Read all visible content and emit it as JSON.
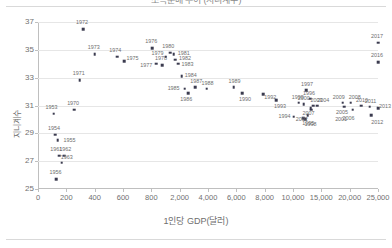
{
  "figure": {
    "title_clipped": "소득분배 추이 (지니계수)",
    "background": "#ffffff",
    "marker_color": "#3b3b4f",
    "grid_color": "#e6e6e6",
    "axis_color": "#bfbfbf",
    "text_color": "#6e6e6e"
  },
  "chart_data": {
    "type": "scatter",
    "title": "소득분배 추이 (지니계수)",
    "xlabel": "1인당 GDP(달러)",
    "ylabel": "지니계수",
    "grid": "horizontal",
    "legend": "none",
    "xscale": "piecewise-compressed",
    "ylim": [
      25,
      37
    ],
    "yticks": [
      25,
      27,
      29,
      31,
      33,
      35,
      37
    ],
    "xticks": [
      0,
      200,
      400,
      600,
      800,
      2000,
      4000,
      6000,
      8000,
      10000,
      15000,
      20000,
      25000
    ],
    "xticklabels": [
      "0",
      "200",
      "400",
      "600",
      "800",
      "2,000",
      "4,000",
      "6,000",
      "8,000",
      "10,000",
      "15,000",
      "20,000",
      "25,000"
    ],
    "point_label_field": "year",
    "points": [
      {
        "year": "1953",
        "x": 110,
        "y": 30.4,
        "lx": -2,
        "ly": -7
      },
      {
        "year": "1954",
        "x": 120,
        "y": 28.9,
        "lx": -1,
        "ly": -7
      },
      {
        "year": "1955",
        "x": 138,
        "y": 28.5,
        "lx": 12,
        "ly": 0
      },
      {
        "year": "1956",
        "x": 130,
        "y": 25.7,
        "lx": -1,
        "ly": -7
      },
      {
        "year": "1961",
        "x": 150,
        "y": 27.4,
        "lx": -3,
        "ly": -7
      },
      {
        "year": "1962",
        "x": 185,
        "y": 27.4,
        "lx": 1,
        "ly": -7
      },
      {
        "year": "1963",
        "x": 168,
        "y": 26.9,
        "lx": 5,
        "ly": -6
      },
      {
        "year": "1970",
        "x": 255,
        "y": 30.7,
        "lx": -1,
        "ly": -7
      },
      {
        "year": "1971",
        "x": 295,
        "y": 32.8,
        "lx": -1,
        "ly": -7
      },
      {
        "year": "1972",
        "x": 318,
        "y": 36.5,
        "lx": -1,
        "ly": -7
      },
      {
        "year": "1973",
        "x": 400,
        "y": 34.7,
        "lx": -1,
        "ly": -7
      },
      {
        "year": "1974",
        "x": 560,
        "y": 34.5,
        "lx": -2,
        "ly": -7
      },
      {
        "year": "1975",
        "x": 610,
        "y": 34.2,
        "lx": 8,
        "ly": -3
      },
      {
        "year": "1976",
        "x": 840,
        "y": 35.1,
        "lx": -1,
        "ly": -7
      },
      {
        "year": "1977",
        "x": 1010,
        "y": 34.0,
        "lx": -10,
        "ly": 1
      },
      {
        "year": "1978",
        "x": 1250,
        "y": 33.9,
        "lx": -1,
        "ly": -7
      },
      {
        "year": "1979",
        "x": 1400,
        "y": 34.5,
        "lx": -8,
        "ly": -4
      },
      {
        "year": "1980",
        "x": 1600,
        "y": 34.8,
        "lx": -2,
        "ly": -7
      },
      {
        "year": "1981",
        "x": 1750,
        "y": 34.7,
        "lx": 10,
        "ly": -1
      },
      {
        "year": "1982",
        "x": 1800,
        "y": 34.3,
        "lx": 10,
        "ly": -2
      },
      {
        "year": "1983",
        "x": 1950,
        "y": 34.0,
        "lx": 9,
        "ly": 0
      },
      {
        "year": "1984",
        "x": 2150,
        "y": 33.1,
        "lx": 9,
        "ly": -1
      },
      {
        "year": "1985",
        "x": 2350,
        "y": 32.2,
        "lx": -11,
        "ly": -1
      },
      {
        "year": "1986",
        "x": 2600,
        "y": 31.9,
        "lx": -2,
        "ly": 6
      },
      {
        "year": "1987",
        "x": 3100,
        "y": 32.3,
        "lx": 1,
        "ly": -6
      },
      {
        "year": "1988",
        "x": 3900,
        "y": 32.2,
        "lx": 1,
        "ly": -6
      },
      {
        "year": "1989",
        "x": 5800,
        "y": 32.3,
        "lx": 1,
        "ly": -6
      },
      {
        "year": "1990",
        "x": 6400,
        "y": 31.9,
        "lx": 3,
        "ly": 6
      },
      {
        "year": "1992",
        "x": 7900,
        "y": 31.8,
        "lx": 7,
        "ly": 3
      },
      {
        "year": "1993",
        "x": 8800,
        "y": 31.4,
        "lx": 4,
        "ly": 6
      },
      {
        "year": "1994",
        "x": 10100,
        "y": 30.2,
        "lx": -9,
        "ly": -1
      },
      {
        "year": "1995",
        "x": 11800,
        "y": 30.1,
        "lx": 5,
        "ly": 5
      },
      {
        "year": "1996",
        "x": 13000,
        "y": 31.5,
        "lx": -1,
        "ly": -6
      },
      {
        "year": "1997",
        "x": 12300,
        "y": 32.1,
        "lx": 1,
        "ly": -6
      },
      {
        "year": "1998",
        "x": 12200,
        "y": 30.0,
        "lx": 5,
        "ly": 5
      },
      {
        "year": "1999",
        "x": 11000,
        "y": 31.2,
        "lx": -1,
        "ly": -6
      },
      {
        "year": "2000",
        "x": 11900,
        "y": 31.1,
        "lx": 0,
        "ly": -6
      },
      {
        "year": "2001",
        "x": 13200,
        "y": 30.7,
        "lx": 30,
        "ly": 9
      },
      {
        "year": "2002",
        "x": 12600,
        "y": 30.3,
        "lx": -6,
        "ly": 4
      },
      {
        "year": "2003",
        "x": 13600,
        "y": 31.0,
        "lx": 3,
        "ly": -6
      },
      {
        "year": "2004",
        "x": 14300,
        "y": 31.0,
        "lx": 6,
        "ly": -6
      },
      {
        "year": "2005",
        "x": 19000,
        "y": 30.9,
        "lx": -2,
        "ly": 5
      },
      {
        "year": "2006",
        "x": 20500,
        "y": 30.7,
        "lx": -4,
        "ly": 8
      },
      {
        "year": "2007",
        "x": 13100,
        "y": 30.8,
        "lx": -2,
        "ly": 5
      },
      {
        "year": "2008",
        "x": 20200,
        "y": 31.2,
        "lx": 4,
        "ly": -6
      },
      {
        "year": "2009",
        "x": 18800,
        "y": 31.2,
        "lx": -4,
        "ly": -6
      },
      {
        "year": "2010",
        "x": 22000,
        "y": 31.0,
        "lx": 1,
        "ly": -6
      },
      {
        "year": "2011",
        "x": 23500,
        "y": 30.9,
        "lx": 1,
        "ly": -6
      },
      {
        "year": "2012",
        "x": 23800,
        "y": 30.3,
        "lx": 6,
        "ly": 7
      },
      {
        "year": "2013",
        "x": 25200,
        "y": 30.8,
        "lx": 7,
        "ly": -2
      },
      {
        "year": "2016",
        "x": 26400,
        "y": 34.1,
        "lx": -1,
        "ly": -7
      },
      {
        "year": "2017",
        "x": 26600,
        "y": 35.5,
        "lx": -1,
        "ly": -7
      }
    ]
  }
}
